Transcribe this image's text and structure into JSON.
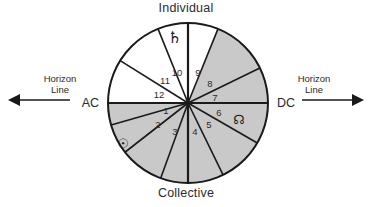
{
  "figure": {
    "title_top": "Individual",
    "title_bottom": "Collective",
    "axis": {
      "ascendant": "AC",
      "descendant": "DC",
      "horizon_label_line1": "Horizon",
      "horizon_label_line2": "Line",
      "left_arrow_icon": "left-arrow-icon",
      "right_arrow_icon": "right-arrow-icon"
    },
    "colors": {
      "shaded_sector": "#c9c9c9",
      "unshaded_sector": "#ffffff",
      "stroke": "#1a1a1a",
      "text": "#2b2b2b"
    },
    "geometry": {
      "center_x": 188,
      "center_y": 103,
      "radius": 80
    },
    "houses": [
      {
        "number": "1",
        "start_deg": 180,
        "end_deg": 196,
        "shaded": true,
        "label_x": 166,
        "label_y": 114
      },
      {
        "number": "2",
        "start_deg": 196,
        "end_deg": 218,
        "shaded": true,
        "label_x": 158,
        "label_y": 128
      },
      {
        "number": "3",
        "start_deg": 218,
        "end_deg": 250,
        "shaded": true,
        "label_x": 175,
        "label_y": 135
      },
      {
        "number": "4",
        "start_deg": 250,
        "end_deg": 270,
        "shaded": true,
        "label_x": 195,
        "label_y": 135
      },
      {
        "number": "5",
        "start_deg": 270,
        "end_deg": 296,
        "shaded": true,
        "label_x": 209,
        "label_y": 128
      },
      {
        "number": "6",
        "start_deg": 296,
        "end_deg": 330,
        "shaded": true,
        "label_x": 219,
        "label_y": 116
      },
      {
        "number": "7",
        "start_deg": 330,
        "end_deg": 360,
        "shaded": true,
        "label_x": 215,
        "label_y": 101
      },
      {
        "number": "8",
        "start_deg": 0,
        "end_deg": 26,
        "shaded": true,
        "label_x": 210,
        "label_y": 87
      },
      {
        "number": "9",
        "start_deg": 26,
        "end_deg": 68,
        "shaded": true,
        "label_x": 198,
        "label_y": 76
      },
      {
        "number": "10",
        "start_deg": 68,
        "end_deg": 112,
        "shaded": false,
        "label_x": 177,
        "label_y": 76
      },
      {
        "number": "11",
        "start_deg": 112,
        "end_deg": 148,
        "shaded": false,
        "label_x": 165,
        "label_y": 84
      },
      {
        "number": "12",
        "start_deg": 148,
        "end_deg": 180,
        "shaded": false,
        "label_x": 159,
        "label_y": 98
      }
    ],
    "planet_glyphs": [
      {
        "name": "saturn-glyph",
        "symbol": "♄",
        "house": "10",
        "x": 175,
        "y": 43,
        "size": 16
      },
      {
        "name": "north-node-glyph",
        "symbol": "☊",
        "house": "6",
        "x": 239,
        "y": 124,
        "size": 13
      },
      {
        "name": "sun-glyph",
        "symbol": "☉",
        "house": "2",
        "x": 123,
        "y": 148,
        "size": 13
      }
    ]
  }
}
